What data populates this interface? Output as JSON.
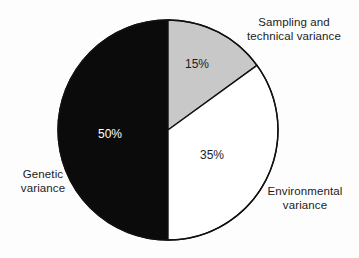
{
  "figure": {
    "background_color": "#fdfdfd",
    "width": 359,
    "height": 258
  },
  "chart_data": {
    "type": "pie",
    "title": "",
    "subtitle": "",
    "xlabel": "",
    "ylabel": "",
    "legend_position": "none",
    "grid": false,
    "units": "percent",
    "total": 100,
    "start_angle_deg": 0,
    "direction": "clockwise",
    "center": {
      "x": 168,
      "y": 130
    },
    "radius": 110,
    "stroke_color": "#111111",
    "stroke_width": 1.4,
    "categories": [
      "Sampling and technical variance",
      "Environmental variance",
      "Genetic variance"
    ],
    "values": [
      15,
      35,
      50
    ],
    "labels": [
      "15%",
      "35%",
      "50%"
    ],
    "colors": [
      "#c8c8c8",
      "#ffffff",
      "#0b0b0b"
    ],
    "slices": [
      {
        "name": "Sampling and technical variance",
        "value": 15,
        "label": "15%",
        "fill": "#c8c8c8",
        "label_color": "#1c1c1c",
        "start_angle_deg": 0,
        "end_angle_deg": 54
      },
      {
        "name": "Environmental variance",
        "value": 35,
        "label": "35%",
        "fill": "#ffffff",
        "label_color": "#1c1c1c",
        "start_angle_deg": 54,
        "end_angle_deg": 180
      },
      {
        "name": "Genetic variance",
        "value": 50,
        "label": "50%",
        "fill": "#0b0b0b",
        "label_color": "#ffffff",
        "start_angle_deg": 180,
        "end_angle_deg": 360
      }
    ]
  },
  "labels": {
    "sampling": {
      "line1": "Sampling and",
      "line2": "technical variance"
    },
    "environmental": {
      "line1": "Environmental",
      "line2": "variance"
    },
    "genetic": {
      "line1": "Genetic",
      "line2": "variance"
    }
  },
  "values": {
    "sampling": "15%",
    "environmental": "35%",
    "genetic": "50%"
  }
}
